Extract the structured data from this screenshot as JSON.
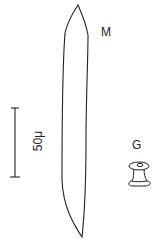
{
  "figure": {
    "labels": {
      "spicule_m": "M",
      "spicule_g": "G"
    },
    "scale_bar": {
      "text": "50μ",
      "length_px": 69,
      "orientation": "vertical"
    },
    "colors": {
      "stroke": "#222222",
      "background": "#ffffff"
    }
  }
}
